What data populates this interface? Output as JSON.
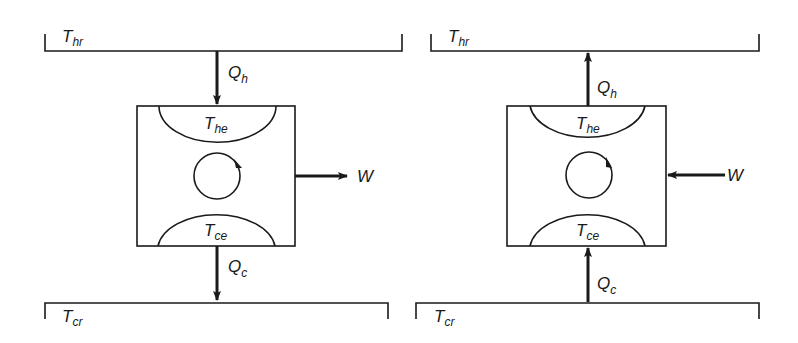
{
  "diagram": {
    "panels": [
      {
        "id": "engine",
        "hot_reservoir": {
          "label": "T",
          "subscript": "hr"
        },
        "cold_reservoir": {
          "label": "T",
          "subscript": "cr"
        },
        "hot_exchanger": {
          "label": "T",
          "subscript": "he"
        },
        "cold_exchanger": {
          "label": "T",
          "subscript": "ce"
        },
        "heat_hot": {
          "label": "Q",
          "subscript": "h",
          "direction": "down"
        },
        "heat_cold": {
          "label": "Q",
          "subscript": "c",
          "direction": "down"
        },
        "work": {
          "label": "W",
          "direction": "out"
        },
        "cycle": "clockwise"
      },
      {
        "id": "pump",
        "hot_reservoir": {
          "label": "T",
          "subscript": "hr"
        },
        "cold_reservoir": {
          "label": "T",
          "subscript": "cr"
        },
        "hot_exchanger": {
          "label": "T",
          "subscript": "he"
        },
        "cold_exchanger": {
          "label": "T",
          "subscript": "ce"
        },
        "heat_hot": {
          "label": "Q",
          "subscript": "h",
          "direction": "up"
        },
        "heat_cold": {
          "label": "Q",
          "subscript": "c",
          "direction": "up"
        },
        "work": {
          "label": "W",
          "direction": "in"
        },
        "cycle": "clockwise"
      }
    ],
    "colors": {
      "ink": "#1a1a1a",
      "background": "#ffffff"
    }
  }
}
